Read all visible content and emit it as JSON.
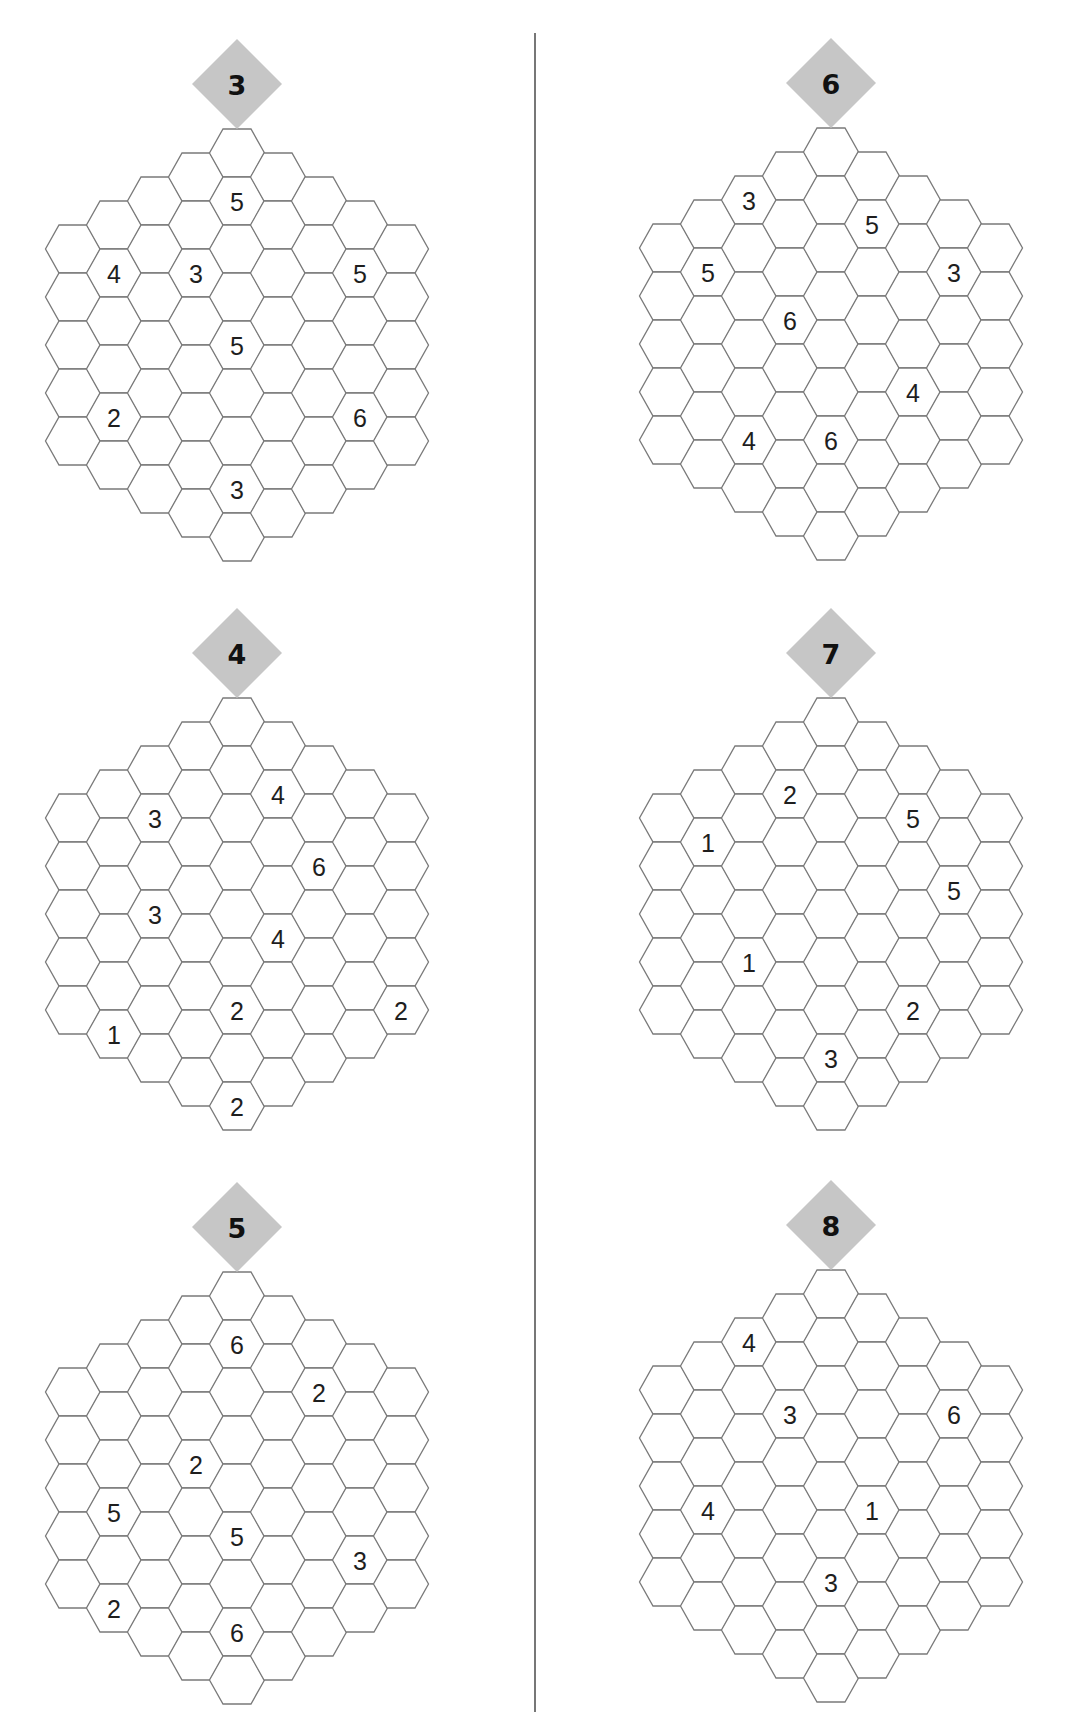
{
  "page": {
    "divider": {
      "x": 535,
      "y1": 33,
      "y2": 1712
    },
    "colors": {
      "hex_stroke": "#7a7a7a",
      "badge_fill": "#c6c6c6",
      "text": "#1e1e1e"
    }
  },
  "grid": {
    "shape": "hexagon of hexagons, radius 4",
    "column_cell_counts": [
      5,
      6,
      7,
      8,
      9,
      8,
      7,
      6,
      5
    ]
  },
  "puzzles": [
    {
      "number": "3",
      "clues": [
        {
          "col": 4,
          "row": 1,
          "value": "5"
        },
        {
          "col": 1,
          "row": 1,
          "value": "4"
        },
        {
          "col": 3,
          "row": 2,
          "value": "3"
        },
        {
          "col": 7,
          "row": 1,
          "value": "5"
        },
        {
          "col": 4,
          "row": 4,
          "value": "5"
        },
        {
          "col": 1,
          "row": 4,
          "value": "2"
        },
        {
          "col": 7,
          "row": 4,
          "value": "6"
        },
        {
          "col": 4,
          "row": 7,
          "value": "3"
        }
      ]
    },
    {
      "number": "4",
      "clues": [
        {
          "col": 5,
          "row": 1,
          "value": "4"
        },
        {
          "col": 2,
          "row": 1,
          "value": "3"
        },
        {
          "col": 6,
          "row": 2,
          "value": "6"
        },
        {
          "col": 2,
          "row": 3,
          "value": "3"
        },
        {
          "col": 5,
          "row": 4,
          "value": "4"
        },
        {
          "col": 4,
          "row": 6,
          "value": "2"
        },
        {
          "col": 8,
          "row": 4,
          "value": "2"
        },
        {
          "col": 1,
          "row": 5,
          "value": "1"
        },
        {
          "col": 4,
          "row": 8,
          "value": "2"
        }
      ]
    },
    {
      "number": "5",
      "clues": [
        {
          "col": 4,
          "row": 1,
          "value": "6"
        },
        {
          "col": 6,
          "row": 1,
          "value": "2"
        },
        {
          "col": 3,
          "row": 3,
          "value": "2"
        },
        {
          "col": 1,
          "row": 3,
          "value": "5"
        },
        {
          "col": 4,
          "row": 5,
          "value": "5"
        },
        {
          "col": 7,
          "row": 4,
          "value": "3"
        },
        {
          "col": 1,
          "row": 5,
          "value": "2"
        },
        {
          "col": 4,
          "row": 7,
          "value": "6"
        }
      ]
    },
    {
      "number": "6",
      "clues": [
        {
          "col": 2,
          "row": 0,
          "value": "3"
        },
        {
          "col": 5,
          "row": 1,
          "value": "5"
        },
        {
          "col": 1,
          "row": 1,
          "value": "5"
        },
        {
          "col": 7,
          "row": 1,
          "value": "3"
        },
        {
          "col": 3,
          "row": 3,
          "value": "6"
        },
        {
          "col": 6,
          "row": 4,
          "value": "4"
        },
        {
          "col": 2,
          "row": 5,
          "value": "4"
        },
        {
          "col": 4,
          "row": 6,
          "value": "6"
        }
      ]
    },
    {
      "number": "7",
      "clues": [
        {
          "col": 3,
          "row": 1,
          "value": "2"
        },
        {
          "col": 6,
          "row": 1,
          "value": "5"
        },
        {
          "col": 1,
          "row": 1,
          "value": "1"
        },
        {
          "col": 7,
          "row": 2,
          "value": "5"
        },
        {
          "col": 2,
          "row": 4,
          "value": "1"
        },
        {
          "col": 6,
          "row": 5,
          "value": "2"
        },
        {
          "col": 4,
          "row": 7,
          "value": "3"
        }
      ]
    },
    {
      "number": "8",
      "clues": [
        {
          "col": 2,
          "row": 0,
          "value": "4"
        },
        {
          "col": 3,
          "row": 2,
          "value": "3"
        },
        {
          "col": 7,
          "row": 1,
          "value": "6"
        },
        {
          "col": 1,
          "row": 3,
          "value": "4"
        },
        {
          "col": 5,
          "row": 4,
          "value": "1"
        },
        {
          "col": 4,
          "row": 6,
          "value": "3"
        }
      ]
    }
  ]
}
